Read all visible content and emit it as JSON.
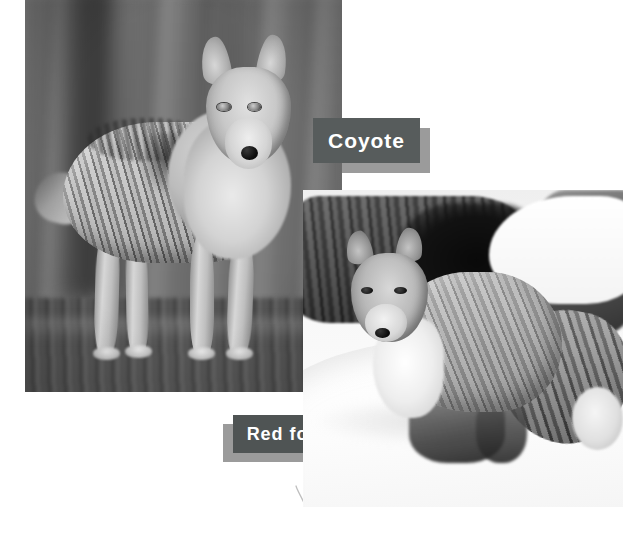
{
  "page": {
    "background_color": "#ffffff",
    "width": 625,
    "height": 543
  },
  "photos": [
    {
      "id": "coyote",
      "caption": "Coyote",
      "subject": "coyote standing on grass facing the camera",
      "treatment": "grayscale photograph",
      "position": {
        "x": 25,
        "y": 0,
        "width": 317,
        "height": 392
      },
      "z": 1
    },
    {
      "id": "redfox",
      "caption": "Red fox",
      "subject": "red fox standing in snow beside a fallen log",
      "treatment": "grayscale photograph",
      "position": {
        "x": 303,
        "y": 190,
        "width": 320,
        "height": 317
      },
      "z": 2
    }
  ],
  "captions": {
    "coyote": {
      "label": "Coyote",
      "box_color": "#575c5c",
      "shadow_color": "#9b9b9b",
      "text_color": "#ffffff",
      "shadow_offset": "down-right"
    },
    "redfox": {
      "label": "Red fox",
      "box_color": "#4f5454",
      "shadow_color": "#9b9b9b",
      "text_color": "#ffffff",
      "shadow_offset": "down-left"
    }
  },
  "marks": [
    {
      "id": "stray-pencil-mark",
      "description": "small curved pencil stroke",
      "x": 293,
      "y": 484
    }
  ]
}
